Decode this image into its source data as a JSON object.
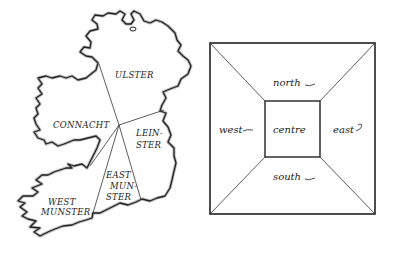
{
  "map": {
    "title": "Ireland provinces",
    "regions": [
      {
        "name": "ulster",
        "label": "ULSTER"
      },
      {
        "name": "connacht",
        "label": "CONNACHT"
      },
      {
        "name": "leinster",
        "label_line1": "LEIN-",
        "label_line2": "STER"
      },
      {
        "name": "east-munster",
        "label_line1": "EAST",
        "label_line2": "MUN-",
        "label_line3": "STER"
      },
      {
        "name": "west-munster",
        "label_line1": "WEST",
        "label_line2": "MUNSTER"
      }
    ]
  },
  "compass_square": {
    "north": "north",
    "south": "south",
    "east": "east",
    "west": "west",
    "centre": "centre"
  },
  "colors": {
    "ink": "#222222",
    "background": "#ffffff"
  }
}
